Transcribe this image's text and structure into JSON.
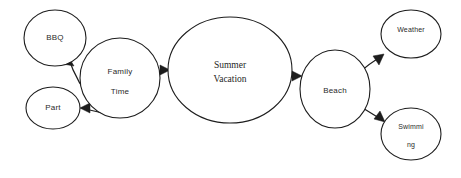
{
  "diagram": {
    "type": "mind-map",
    "background_color": "#ffffff",
    "stroke_color": "#1d1d1d",
    "text_color": "#2a2a2a",
    "nodes": [
      {
        "id": "bbq",
        "label": "BBQ",
        "lines": [
          "BBQ"
        ],
        "shape": "ellipse",
        "cx": 55,
        "cy": 38,
        "rx": 31,
        "ry": 28,
        "font": "sans-md"
      },
      {
        "id": "part",
        "label": "Part",
        "lines": [
          "Part"
        ],
        "shape": "ellipse",
        "cx": 53,
        "cy": 108,
        "rx": 27,
        "ry": 21,
        "font": "sans-md"
      },
      {
        "id": "family-time",
        "label": "Family Time",
        "lines": [
          "Family",
          "Time"
        ],
        "shape": "ellipse",
        "cx": 120,
        "cy": 78,
        "rx": 40,
        "ry": 40,
        "font": "sans-md"
      },
      {
        "id": "summer-vacation",
        "label": "Summer Vacation",
        "lines": [
          "Summer",
          "Vacation"
        ],
        "shape": "ellipse",
        "cx": 230,
        "cy": 70,
        "rx": 62,
        "ry": 53,
        "font": "serif-lg"
      },
      {
        "id": "beach",
        "label": "Beach",
        "lines": [
          "Beach"
        ],
        "shape": "ellipse",
        "cx": 335,
        "cy": 89,
        "rx": 35,
        "ry": 39,
        "font": "sans-md"
      },
      {
        "id": "weather",
        "label": "Weather",
        "lines": [
          "Weather"
        ],
        "shape": "ellipse",
        "cx": 411,
        "cy": 34,
        "rx": 30,
        "ry": 24,
        "font": "sans-sm"
      },
      {
        "id": "swimming",
        "label": "Swimming",
        "lines": [
          "Swimmi",
          "ng"
        ],
        "shape": "ellipse",
        "cx": 411,
        "cy": 134,
        "rx": 30,
        "ry": 26,
        "font": "sans-sm"
      }
    ],
    "edges": [
      {
        "id": "family-time-to-bbq",
        "from": "family-time",
        "to": "bbq",
        "direction": "to-bbq"
      },
      {
        "id": "family-time-to-part",
        "from": "family-time",
        "to": "part",
        "direction": "to-part"
      },
      {
        "id": "family-time-to-summer-vacation",
        "from": "family-time",
        "to": "summer-vacation",
        "direction": "to-summer-vacation"
      },
      {
        "id": "summer-vacation-to-beach",
        "from": "summer-vacation",
        "to": "beach",
        "direction": "to-beach"
      },
      {
        "id": "beach-to-weather",
        "from": "beach",
        "to": "weather",
        "direction": "to-weather"
      },
      {
        "id": "beach-to-swimming",
        "from": "beach",
        "to": "swimming",
        "direction": "to-swimming"
      }
    ]
  }
}
